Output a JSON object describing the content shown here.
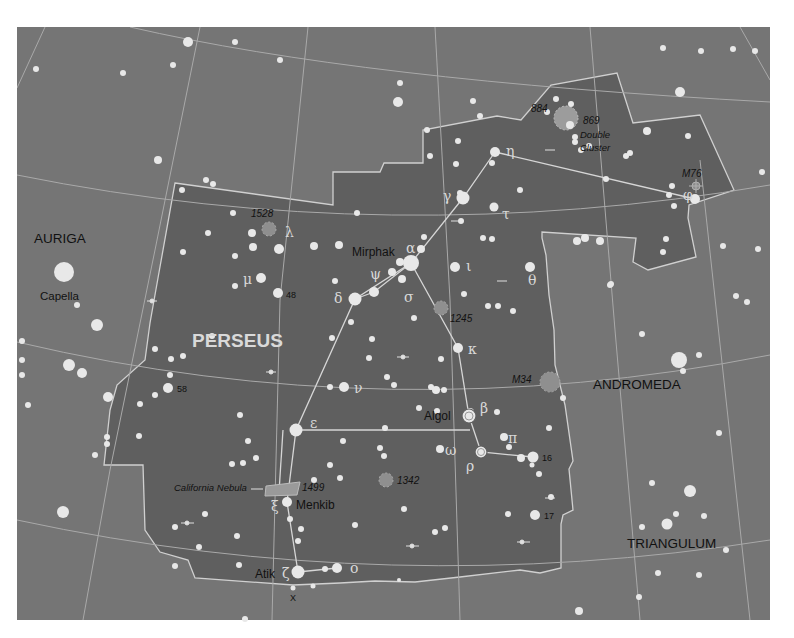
{
  "colors": {
    "background": "#757575",
    "constellation_fill": "#5e5e5e",
    "boundary_line": "#cfcfcf",
    "grid_line": "#a8a8a8",
    "star": "#e6e6e6",
    "cluster": "#9a9a9a",
    "label": "#111111",
    "greek": "#d6d6d6",
    "main_title": "#d9d9d9"
  },
  "title": "PERSEUS",
  "neighbors": [
    {
      "name": "AURIGA",
      "x": 34,
      "y": 243
    },
    {
      "name": "ANDROMEDA",
      "x": 593,
      "y": 389
    },
    {
      "name": "TRIANGULUM",
      "x": 627,
      "y": 548
    }
  ],
  "named_stars": [
    {
      "name": "Capella",
      "x": 40,
      "y": 300
    },
    {
      "name": "Mirphak",
      "x": 352,
      "y": 256
    },
    {
      "name": "Algol",
      "x": 424,
      "y": 419
    },
    {
      "name": "Menkib",
      "x": 296,
      "y": 509
    },
    {
      "name": "Atik",
      "x": 255,
      "y": 577
    }
  ],
  "deep_sky": [
    {
      "label": "884",
      "x": 531,
      "y": 112
    },
    {
      "label": "869",
      "x": 583,
      "y": 124
    },
    {
      "label": "Double",
      "x": 580,
      "y": 138
    },
    {
      "label": "Cluster",
      "x": 580,
      "y": 151
    },
    {
      "label": "M76",
      "x": 682,
      "y": 177
    },
    {
      "label": "1528",
      "x": 251,
      "y": 216
    },
    {
      "label": "1245",
      "x": 450,
      "y": 321
    },
    {
      "label": "M34",
      "x": 512,
      "y": 382
    },
    {
      "label": "1342",
      "x": 397,
      "y": 484
    },
    {
      "label": "California Nebula",
      "x": 174,
      "y": 491
    },
    {
      "label": "1499",
      "x": 302,
      "y": 491
    }
  ],
  "star_numbers": [
    {
      "label": "48",
      "x": 286,
      "y": 298
    },
    {
      "label": "58",
      "x": 177,
      "y": 392
    },
    {
      "label": "16",
      "x": 542,
      "y": 461
    },
    {
      "label": "17",
      "x": 544,
      "y": 519
    },
    {
      "label": "X",
      "x": 290,
      "y": 601
    }
  ],
  "greek_letters": [
    {
      "label": "η",
      "x": 506,
      "y": 156
    },
    {
      "label": "γ",
      "x": 443,
      "y": 201
    },
    {
      "label": "τ",
      "x": 502,
      "y": 219
    },
    {
      "label": "λ",
      "x": 285,
      "y": 237
    },
    {
      "label": "α",
      "x": 406,
      "y": 253
    },
    {
      "label": "ι",
      "x": 466,
      "y": 271
    },
    {
      "label": "θ",
      "x": 528,
      "y": 285
    },
    {
      "label": "μ",
      "x": 243,
      "y": 284
    },
    {
      "label": "ψ",
      "x": 370,
      "y": 279
    },
    {
      "label": "δ",
      "x": 334,
      "y": 303
    },
    {
      "label": "σ",
      "x": 404,
      "y": 302
    },
    {
      "label": "κ",
      "x": 468,
      "y": 354
    },
    {
      "label": "ν",
      "x": 354,
      "y": 393
    },
    {
      "label": "β",
      "x": 480,
      "y": 413
    },
    {
      "label": "ε",
      "x": 310,
      "y": 428
    },
    {
      "label": "π",
      "x": 508,
      "y": 443
    },
    {
      "label": "ω",
      "x": 445,
      "y": 455
    },
    {
      "label": "ρ",
      "x": 466,
      "y": 471
    },
    {
      "label": "ξ",
      "x": 271,
      "y": 511
    },
    {
      "label": "ζ",
      "x": 282,
      "y": 578
    },
    {
      "label": "ο",
      "x": 350,
      "y": 573
    },
    {
      "label": "φ",
      "x": 683,
      "y": 200
    }
  ]
}
